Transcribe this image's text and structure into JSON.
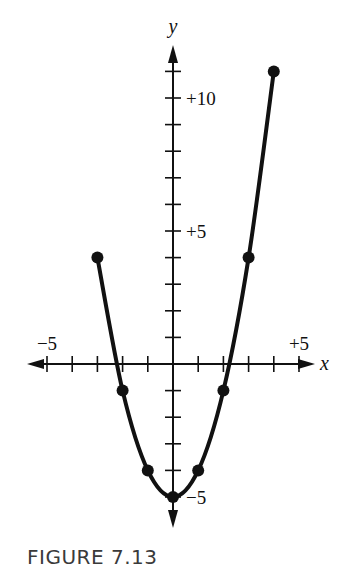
{
  "figure": {
    "caption": "FIGURE 7.13"
  },
  "chart_data": {
    "type": "line",
    "title": "",
    "xlabel": "x",
    "ylabel": "y",
    "xlim": [
      -5,
      5
    ],
    "ylim": [
      -5,
      11
    ],
    "grid": false,
    "legend": null,
    "x_tick_step": 1,
    "y_tick_step": 1,
    "x_tick_labels": [
      {
        "value": -5,
        "label": "−5"
      },
      {
        "value": 5,
        "label": "+5"
      }
    ],
    "y_tick_labels": [
      {
        "value": 10,
        "label": "+10"
      },
      {
        "value": 5,
        "label": "+5"
      },
      {
        "value": -5,
        "label": "−5"
      }
    ],
    "series": [
      {
        "name": "y = x² − 5",
        "x": [
          -3,
          -2,
          -1,
          0,
          1,
          2,
          3,
          4
        ],
        "y": [
          4,
          -1,
          -4,
          -5,
          -4,
          -1,
          4,
          11
        ],
        "marker": "filled-circle",
        "color": "#111111"
      }
    ]
  }
}
